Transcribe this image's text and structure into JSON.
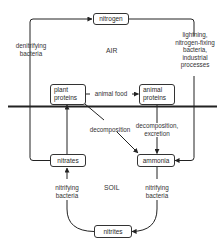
{
  "diagram": {
    "regions": {
      "air": "AIR",
      "soil": "SOIL"
    },
    "nodes": {
      "nitrogen": "nitrogen",
      "plant_proteins": "plant\nproteins",
      "animal_proteins": "animal\nproteins",
      "nitrates": "nitrates",
      "ammonia": "ammonia",
      "nitrites": "nitrites"
    },
    "edges": {
      "denitrifying": "denitrifying\nbacteria",
      "fixation": "lightning,\nnitrogen-fixing\nbacteria,\nindustrial\nprocesses",
      "animal_food": "animal food",
      "decomposition": "decomposition",
      "decomposition_excretion": "decomposition,\nexcretion",
      "nitrifying_left": "nitrifying\nbacteria",
      "nitrifying_right": "nitrifying\nbacteria"
    },
    "colors": {
      "line": "#222222",
      "text": "#333333",
      "background": "#ffffff"
    }
  }
}
